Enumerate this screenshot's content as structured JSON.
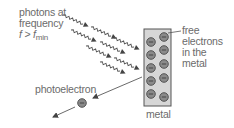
{
  "diagram": {
    "type": "photoelectric-effect",
    "labels": {
      "photons_line1": "photons at",
      "photons_line2": "frequency",
      "photons_f": "f",
      "photons_gt": " > ",
      "photons_fmin": "f",
      "photons_fmin_sub": "min",
      "free_electrons_line1": "free",
      "free_electrons_line2": "electrons",
      "free_electrons_line3": "in the",
      "free_electrons_line4": "metal",
      "photoelectron": "photoelectron",
      "metal": "metal"
    },
    "photon_count": 6,
    "electron_count_in_metal": 10,
    "colors": {
      "text": "#6b6b6b",
      "metal_fill": "#d6d6d6",
      "metal_stroke": "#555555",
      "electron_fill": "#8a8a8a",
      "electron_stroke": "#4a4a4a",
      "arrow": "#444444"
    }
  }
}
